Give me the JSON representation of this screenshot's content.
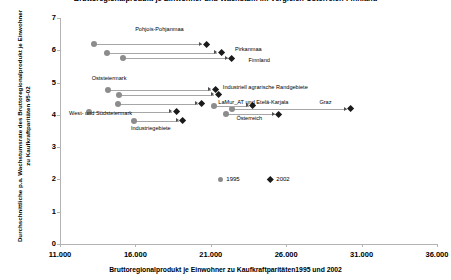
{
  "chart_data": {
    "type": "scatter",
    "title": "Bruttoregionalprodukt je Einwohner und Wachstum im Vergleich Österreich-Finnland",
    "xlabel": "Bruttoregionalprodukt je Einwohner zu Kaufkraftparitäten1995 und 2002",
    "ylabel": "Durchschnittliche p.a. Wachstumsrate des Bruttoregionalprodukt je Einwohner zu Kaufkraftparitäten 95-02",
    "xlim": [
      11000,
      36000
    ],
    "ylim": [
      0,
      7
    ],
    "xticks": [
      "11.000",
      "16.000",
      "21.000",
      "26.000",
      "31.000",
      "36.000"
    ],
    "xtick_values": [
      11000,
      16000,
      21000,
      26000,
      31000,
      36000
    ],
    "yticks": [
      "0",
      "1",
      "2",
      "3",
      "4",
      "5",
      "6",
      "7"
    ],
    "ytick_values": [
      0,
      1,
      2,
      3,
      4,
      5,
      6,
      7
    ],
    "grid": false,
    "legend_position": "bottom-center",
    "series": [
      {
        "name": "1995",
        "marker": "circle",
        "color": "#8c8c8c"
      },
      {
        "name": "2002",
        "marker": "diamond",
        "color": "#1a1a1a"
      }
    ],
    "points": [
      {
        "label": "Pohjois-Pohjanmaa",
        "x_1995": 13250,
        "y_1995": 6.18,
        "x_2002": 20700,
        "y_2002": 6.18,
        "label_x": 19200,
        "label_y": 6.62,
        "label_align": "right"
      },
      {
        "label": "Pirkanmaa",
        "x_1995": 14100,
        "y_1995": 5.93,
        "x_2002": 21700,
        "y_2002": 5.93,
        "label_x": 22600,
        "label_y": 6.0,
        "label_align": "left"
      },
      {
        "label": "Finnland",
        "x_1995": 15150,
        "y_1995": 5.75,
        "x_2002": 22400,
        "y_2002": 5.75,
        "label_x": 23500,
        "label_y": 5.66,
        "label_align": "left"
      },
      {
        "label": "Oststeiermark",
        "x_1995": 14200,
        "y_1995": 4.78,
        "x_2002": 21300,
        "y_2002": 4.78,
        "label_x": 13100,
        "label_y": 5.12,
        "label_align": "left"
      },
      {
        "label": "Industriell agrarische Randgebiete",
        "x_1995": 14900,
        "y_1995": 4.62,
        "x_2002": 21500,
        "y_2002": 4.62,
        "label_x": 21800,
        "label_y": 4.82,
        "label_align": "left"
      },
      {
        "label": "LaMur_AT und Etelä-Karjala",
        "x_1995": 14850,
        "y_1995": 4.34,
        "x_2002": 20400,
        "y_2002": 4.34,
        "label_x": 21500,
        "label_y": 4.36,
        "label_align": "left"
      },
      {
        "label": "West- und Südsteiermark",
        "x_1995": 12900,
        "y_1995": 4.1,
        "x_2002": 18700,
        "y_2002": 4.1,
        "label_x": 11600,
        "label_y": 4.02,
        "label_align": "left"
      },
      {
        "label": "Industriegebiete",
        "x_1995": 15900,
        "y_1995": 3.82,
        "x_2002": 19150,
        "y_2002": 3.82,
        "label_x": 15700,
        "label_y": 3.56,
        "label_align": "left"
      },
      {
        "label": "Graz",
        "x_1995": 22400,
        "y_1995": 4.18,
        "x_2002": 30300,
        "y_2002": 4.18,
        "label_x": 28200,
        "label_y": 4.36,
        "label_align": "left"
      },
      {
        "label": "Österreich",
        "x_1995": 21200,
        "y_1995": 4.28,
        "x_2002": 23800,
        "y_2002": 4.28,
        "label_x": 22700,
        "label_y": 3.86,
        "label_align": "left"
      },
      {
        "label": "",
        "x_1995": 22000,
        "y_1995": 4.02,
        "x_2002": 25500,
        "y_2002": 4.02,
        "label_x": 0,
        "label_y": 0,
        "label_align": "left"
      }
    ],
    "legend": [
      {
        "text": "1995",
        "marker": "circle"
      },
      {
        "text": "2002",
        "marker": "diamond"
      }
    ]
  }
}
